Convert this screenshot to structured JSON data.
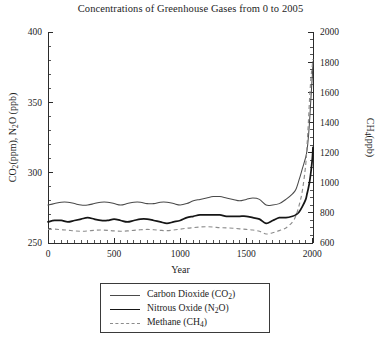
{
  "chart_data": {
    "type": "line",
    "title": "Concentrations of Greenhouse Gases from 0 to 2005",
    "xlabel": "Year",
    "ylabel_left": "CO2(ppm), N2O (ppb)",
    "ylabel_right": "CH4(ppb)",
    "xlim": [
      0,
      2005
    ],
    "ylim_left": [
      250,
      400
    ],
    "ylim_right": [
      600,
      2000
    ],
    "xticks": [
      0,
      500,
      1000,
      1500,
      2000
    ],
    "yticks_left": [
      250,
      300,
      350,
      400
    ],
    "yticks_right": [
      600,
      800,
      1000,
      1200,
      1400,
      1600,
      1800,
      2000
    ],
    "x_minor_step": 50,
    "y_left_minor_step": 10,
    "y_right_minor_step": 50,
    "grid": false,
    "legend_position": "below-plot",
    "series": [
      {
        "name": "Carbon Dioxide (CO2)",
        "axis": "left",
        "units": "ppm",
        "style": "thin-solid",
        "color": "#4a4a4a",
        "x": [
          0,
          50,
          100,
          150,
          200,
          250,
          300,
          350,
          400,
          450,
          500,
          550,
          600,
          650,
          700,
          750,
          800,
          850,
          900,
          950,
          1000,
          1050,
          1100,
          1150,
          1200,
          1250,
          1300,
          1350,
          1400,
          1450,
          1500,
          1550,
          1600,
          1650,
          1700,
          1750,
          1800,
          1850,
          1875,
          1900,
          1925,
          1950,
          1960,
          1970,
          1980,
          1990,
          2000,
          2005
        ],
        "y": [
          277,
          278,
          279,
          279,
          278,
          277,
          277,
          278,
          279,
          279,
          278,
          277,
          278,
          279,
          279,
          278,
          278,
          279,
          279,
          278,
          277,
          278,
          280,
          281,
          282,
          283,
          283,
          282,
          281,
          280,
          281,
          282,
          281,
          277,
          277,
          278,
          281,
          285,
          288,
          295,
          303,
          311,
          316,
          325,
          338,
          354,
          369,
          379
        ]
      },
      {
        "name": "Nitrous Oxide (N2O)",
        "axis": "left",
        "units": "ppb",
        "style": "thick-solid",
        "color": "#161616",
        "x": [
          0,
          50,
          100,
          150,
          200,
          250,
          300,
          350,
          400,
          450,
          500,
          550,
          600,
          650,
          700,
          750,
          800,
          850,
          900,
          950,
          1000,
          1050,
          1100,
          1150,
          1200,
          1250,
          1300,
          1350,
          1400,
          1450,
          1500,
          1550,
          1600,
          1650,
          1700,
          1750,
          1800,
          1850,
          1875,
          1900,
          1925,
          1950,
          1960,
          1970,
          1980,
          1990,
          2000,
          2005
        ],
        "y": [
          265,
          266,
          266,
          265,
          266,
          267,
          268,
          267,
          266,
          266,
          267,
          266,
          265,
          266,
          267,
          267,
          266,
          265,
          264,
          265,
          266,
          268,
          269,
          270,
          270,
          270,
          270,
          269,
          269,
          269,
          269,
          268,
          267,
          264,
          266,
          268,
          268,
          269,
          270,
          272,
          276,
          281,
          285,
          289,
          294,
          301,
          310,
          318
        ]
      },
      {
        "name": "Methane (CH4)",
        "axis": "right",
        "units": "ppb",
        "style": "dashed",
        "color": "#8c8c8c",
        "x": [
          0,
          50,
          100,
          150,
          200,
          250,
          300,
          350,
          400,
          450,
          500,
          550,
          600,
          650,
          700,
          750,
          800,
          850,
          900,
          950,
          1000,
          1050,
          1100,
          1150,
          1200,
          1250,
          1300,
          1350,
          1400,
          1450,
          1500,
          1550,
          1600,
          1650,
          1700,
          1750,
          1800,
          1850,
          1875,
          1900,
          1925,
          1950,
          1960,
          1970,
          1980,
          1990,
          2000,
          2005
        ],
        "y": [
          690,
          692,
          688,
          685,
          680,
          678,
          680,
          684,
          686,
          684,
          680,
          678,
          680,
          684,
          688,
          690,
          688,
          684,
          682,
          686,
          692,
          698,
          702,
          706,
          708,
          706,
          702,
          700,
          698,
          694,
          690,
          686,
          678,
          660,
          668,
          682,
          700,
          740,
          780,
          850,
          950,
          1120,
          1250,
          1400,
          1570,
          1700,
          1780,
          1820
        ]
      }
    ],
    "annotations": []
  },
  "legend": {
    "entries": [
      {
        "label_main": "Carbon Dioxide (CO",
        "label_sub": "2",
        "label_tail": ")"
      },
      {
        "label_main": "Nitrous Oxide (N",
        "label_sub": "2",
        "label_tail": "O)"
      },
      {
        "label_main": "Methane (CH",
        "label_sub": "4",
        "label_tail": ")"
      }
    ]
  },
  "axis_text": {
    "left_part1": "CO",
    "left_sub1": "2",
    "left_part2": "(ppm), N",
    "left_sub2": "2",
    "left_part3": "O (ppb)",
    "right_part1": "CH",
    "right_sub1": "4",
    "right_part2": "(ppb)"
  }
}
